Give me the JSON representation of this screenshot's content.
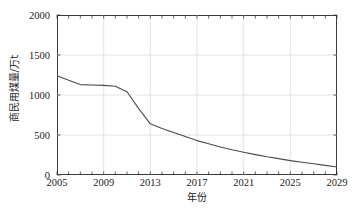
{
  "chart_data": {
    "type": "line",
    "title": "",
    "xlabel": "年份",
    "ylabel": "商民用煤量/万t",
    "xlim": [
      2005,
      2029
    ],
    "ylim": [
      0,
      2000
    ],
    "grid": true,
    "legend": "none",
    "xticks": [
      2005,
      2009,
      2013,
      2017,
      2021,
      2025,
      2029
    ],
    "xtick_labels": [
      "2005",
      "2009",
      "2013",
      "2017",
      "2021",
      "2025",
      "2029"
    ],
    "xminor_step": 1,
    "yticks": [
      0,
      500,
      1000,
      1500,
      2000
    ],
    "ytick_labels": [
      "0",
      "500",
      "1000",
      "1500",
      "2000"
    ],
    "line_color": "#4a4a4a",
    "grid_color": "#d8d8d8",
    "axis_color": "#3a3a3a",
    "series": [
      {
        "name": "商民用煤量",
        "x": [
          2005,
          2006,
          2007,
          2008,
          2009,
          2010,
          2011,
          2012,
          2013,
          2014,
          2015,
          2016,
          2017,
          2018,
          2019,
          2020,
          2021,
          2022,
          2023,
          2024,
          2025,
          2026,
          2027,
          2028,
          2029
        ],
        "values": [
          1240,
          1185,
          1130,
          1125,
          1120,
          1110,
          1040,
          830,
          640,
          580,
          530,
          480,
          430,
          390,
          350,
          315,
          285,
          255,
          228,
          205,
          180,
          160,
          140,
          120,
          100
        ]
      }
    ]
  }
}
